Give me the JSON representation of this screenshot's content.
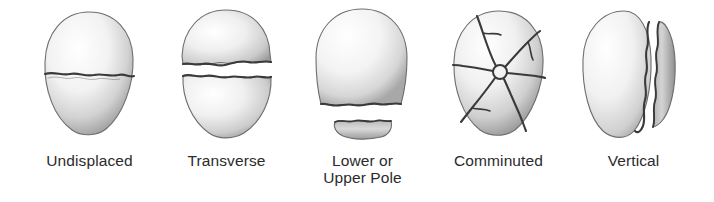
{
  "figure": {
    "background_color": "#ffffff",
    "label_color": "#2b2b2b",
    "bone_fill_light": "#fdfdfd",
    "bone_fill_mid": "#dcdcdc",
    "bone_fill_shadow": "#9a9a9a",
    "crack_color": "#3a3a3a",
    "outline_color": "#6e6e6e"
  },
  "panels": [
    {
      "id": "undisplaced",
      "label": "Undisplaced",
      "icon": "patella-undisplaced-icon",
      "fracture_type": "undisplaced",
      "fragments": 2,
      "gap": "none",
      "crack_orientation": "horizontal",
      "crack_count": 1
    },
    {
      "id": "transverse",
      "label": "Transverse",
      "icon": "patella-transverse-icon",
      "fracture_type": "transverse",
      "fragments": 2,
      "gap": "wide",
      "crack_orientation": "horizontal",
      "crack_count": 1
    },
    {
      "id": "lower-or-upper-pole",
      "label": "Lower or\nUpper Pole",
      "icon": "patella-pole-icon",
      "fracture_type": "pole avulsion",
      "fragments": 2,
      "gap": "displaced distal fragment",
      "crack_orientation": "horizontal-low",
      "crack_count": 1
    },
    {
      "id": "comminuted",
      "label": "Comminuted",
      "icon": "patella-comminuted-icon",
      "fracture_type": "comminuted stellate",
      "fragments": 6,
      "gap": "none",
      "crack_orientation": "radial",
      "crack_count": 6
    },
    {
      "id": "vertical",
      "label": "Vertical",
      "icon": "patella-vertical-icon",
      "fracture_type": "vertical",
      "fragments": 2,
      "gap": "narrow",
      "crack_orientation": "vertical",
      "crack_count": 1
    }
  ]
}
